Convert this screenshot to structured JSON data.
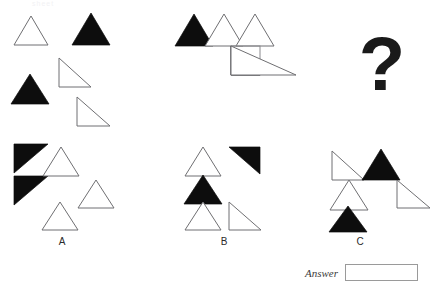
{
  "page": {
    "faint_header_text": "sheet",
    "background_color": "#ffffff",
    "black_color": "#0d0d0d",
    "white_color": "#ffffff",
    "outline_color": "#6f6f72"
  },
  "question": {
    "symbol": "?",
    "name": "question-mark"
  },
  "stimulus": {
    "group_1": {
      "name": "first-figure-group",
      "shapes": [
        {
          "id": "g1-s1",
          "kind": "triangle-up",
          "fill": "white",
          "label": "white-triangle-up"
        },
        {
          "id": "g1-s2",
          "kind": "triangle-up",
          "fill": "black",
          "label": "black-triangle-up"
        },
        {
          "id": "g1-s3",
          "kind": "triangle-up",
          "fill": "black",
          "label": "black-triangle-up"
        },
        {
          "id": "g1-s4",
          "kind": "right-triangle-bl",
          "fill": "white",
          "label": "white-right-triangle"
        },
        {
          "id": "g1-s5",
          "kind": "right-triangle-bl",
          "fill": "white",
          "label": "white-right-triangle"
        }
      ]
    },
    "group_2": {
      "name": "second-figure-group",
      "shapes": [
        {
          "id": "g2-s1",
          "kind": "triangle-up",
          "fill": "black",
          "label": "black-triangle-up"
        },
        {
          "id": "g2-s2",
          "kind": "triangle-up",
          "fill": "white",
          "label": "white-triangle-up"
        },
        {
          "id": "g2-s3",
          "kind": "triangle-up",
          "fill": "white",
          "label": "white-triangle-up"
        },
        {
          "id": "g2-s4",
          "kind": "right-triangle-bl",
          "fill": "black",
          "label": "black-right-triangle"
        },
        {
          "id": "g2-s5",
          "kind": "right-triangle-bl",
          "fill": "white",
          "label": "white-right-triangle"
        }
      ]
    }
  },
  "options": [
    {
      "id": "A",
      "letter": "A",
      "name": "option-a",
      "shapes": [
        {
          "id": "a-s1",
          "kind": "right-triangle-tl",
          "fill": "black",
          "label": "black-right-triangle"
        },
        {
          "id": "a-s2",
          "kind": "right-triangle-tl",
          "fill": "black",
          "label": "black-right-triangle"
        },
        {
          "id": "a-s3",
          "kind": "triangle-up",
          "fill": "white",
          "label": "white-triangle-up"
        },
        {
          "id": "a-s4",
          "kind": "triangle-up",
          "fill": "white",
          "label": "white-triangle-up"
        },
        {
          "id": "a-s5",
          "kind": "triangle-up",
          "fill": "white",
          "label": "white-triangle-up"
        }
      ]
    },
    {
      "id": "B",
      "letter": "B",
      "name": "option-b",
      "shapes": [
        {
          "id": "b-s1",
          "kind": "triangle-up",
          "fill": "white",
          "label": "white-triangle-up"
        },
        {
          "id": "b-s2",
          "kind": "right-triangle-tl",
          "fill": "black",
          "label": "black-right-triangle"
        },
        {
          "id": "b-s3",
          "kind": "triangle-up",
          "fill": "black",
          "label": "black-triangle-up"
        },
        {
          "id": "b-s4",
          "kind": "triangle-up",
          "fill": "white",
          "label": "white-triangle-up"
        },
        {
          "id": "b-s5",
          "kind": "right-triangle-bl",
          "fill": "white",
          "label": "white-right-triangle"
        }
      ]
    },
    {
      "id": "C",
      "letter": "C",
      "name": "option-c",
      "shapes": [
        {
          "id": "c-s1",
          "kind": "right-triangle-bl",
          "fill": "white",
          "label": "white-right-triangle"
        },
        {
          "id": "c-s2",
          "kind": "triangle-up",
          "fill": "black",
          "label": "black-triangle-up"
        },
        {
          "id": "c-s3",
          "kind": "right-triangle-bl",
          "fill": "white",
          "label": "white-right-triangle"
        },
        {
          "id": "c-s4",
          "kind": "triangle-up",
          "fill": "white",
          "label": "white-triangle-up"
        },
        {
          "id": "c-s5",
          "kind": "triangle-up",
          "fill": "black",
          "label": "black-triangle-up"
        }
      ]
    }
  ],
  "answer": {
    "label": "Answer",
    "value": "",
    "placeholder": ""
  }
}
